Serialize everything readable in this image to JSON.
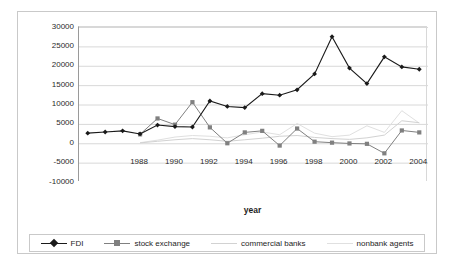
{
  "chart_data": {
    "type": "line",
    "title": "",
    "xlabel": "year",
    "ylabel": "",
    "ylim": [
      -10000,
      30000
    ],
    "ytick_step": 5000,
    "grid": true,
    "legend_position": "bottom",
    "x": [
      1985,
      1986,
      1987,
      1988,
      1989,
      1990,
      1991,
      1992,
      1993,
      1994,
      1995,
      1996,
      1997,
      1998,
      1999,
      2000,
      2001,
      2002,
      2003,
      2004
    ],
    "x_tick_labels": [
      "1988",
      "1990",
      "1992",
      "1994",
      "1996",
      "1998",
      "2000",
      "2002",
      "2004"
    ],
    "y_tick_labels": [
      "30000",
      "25000",
      "20000",
      "15000",
      "10000",
      "5000",
      "0",
      "-5000",
      "-10000"
    ],
    "series": [
      {
        "name": "FDI",
        "color": "#1a1a1a",
        "marker": "diamond",
        "values": [
          2600,
          2900,
          3200,
          2400,
          4700,
          4300,
          4200,
          10900,
          9500,
          9200,
          12800,
          12400,
          13800,
          17900,
          27500,
          19400,
          15400,
          22300,
          19700,
          19100
        ]
      },
      {
        "name": "stock exchange",
        "color": "#808080",
        "marker": "square",
        "values": [
          null,
          null,
          null,
          2300,
          6400,
          4800,
          10600,
          4100,
          0,
          2800,
          3200,
          -600,
          3800,
          400,
          150,
          -50,
          -150,
          -2600,
          3300,
          2800
        ]
      },
      {
        "name": "commercial banks",
        "color": "#d2d2d2",
        "marker": "none",
        "values": [
          null,
          null,
          null,
          100,
          500,
          900,
          1200,
          900,
          500,
          900,
          1300,
          1800,
          2000,
          1500,
          1200,
          1000,
          1400,
          2100,
          5800,
          5300
        ]
      },
      {
        "name": "nonbank agents",
        "color": "#e0e0e0",
        "marker": "none",
        "values": [
          null,
          null,
          null,
          150,
          800,
          1600,
          2000,
          1800,
          1400,
          2200,
          2900,
          2200,
          5100,
          2600,
          1700,
          2100,
          4500,
          2800,
          8400,
          5200
        ]
      }
    ]
  },
  "axis": {
    "x_title": "year"
  },
  "legend": {
    "entries": [
      {
        "label": "FDI"
      },
      {
        "label": "stock exchange"
      },
      {
        "label": "commercial banks"
      },
      {
        "label": "nonbank agents"
      }
    ]
  },
  "colors": {
    "fdi": "#1a1a1a",
    "stock_exchange": "#808080",
    "commercial_banks": "#d2d2d2",
    "nonbank_agents": "#e0e0e0",
    "gridline": "#d8d8d8",
    "axis": "#9a9a9a",
    "frame": "#c9c9c9",
    "text": "#2b2b2b"
  }
}
